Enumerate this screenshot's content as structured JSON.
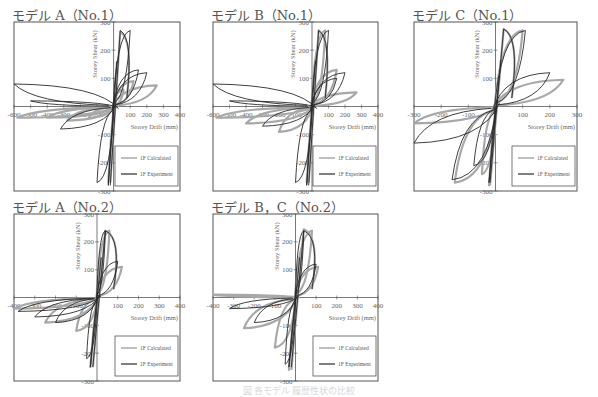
{
  "caption": "図 各モデル 履歴性状の比較",
  "colors": {
    "calculated": "#a8a8a8",
    "experiment": "#2a2a2a",
    "frame": "#555555"
  },
  "legend": {
    "calculated": "1F Calculated",
    "experiment": "1F Experiment"
  },
  "chart_data": [
    {
      "type": "line",
      "title": "モデル A（No.1）",
      "xlabel": "Storey Drift (mm)",
      "ylabel": "Storey Shear (kN)",
      "xlim": [
        -600,
        400
      ],
      "ylim": [
        -300,
        300
      ],
      "xticks": [
        -600,
        -500,
        -400,
        -300,
        -200,
        -100,
        100,
        200,
        300,
        400
      ],
      "yticks": [
        300,
        200,
        100,
        -100,
        -200,
        -300
      ],
      "box": [
        14,
        22,
        180,
        191
      ],
      "series": [
        {
          "name": "1F Calculated",
          "peaks": [
            [
              260,
              75
            ],
            [
              120,
              90
            ],
            [
              60,
              60
            ],
            [
              -150,
              -40
            ],
            [
              -280,
              -50
            ],
            [
              -400,
              -40
            ],
            [
              -580,
              -40
            ]
          ],
          "ymax": 265,
          "ymin": -270
        },
        {
          "name": "1F Experiment",
          "peaks": [
            [
              100,
              270
            ],
            [
              200,
              120
            ],
            [
              150,
              130
            ],
            [
              -100,
              -270
            ],
            [
              -320,
              -80
            ],
            [
              -500,
              20
            ],
            [
              -600,
              80
            ]
          ],
          "ymax": 270,
          "ymin": -280
        }
      ]
    },
    {
      "type": "line",
      "title": "モデル B（No.1）",
      "xlabel": "Storey Drift (mm)",
      "ylabel": "Storey Shear (kN)",
      "xlim": [
        -600,
        400
      ],
      "ylim": [
        -300,
        300
      ],
      "xticks": [
        -600,
        -500,
        -400,
        -300,
        -200,
        -100,
        100,
        200,
        300,
        400
      ],
      "yticks": [
        300,
        200,
        100,
        -100,
        -200,
        -300
      ],
      "box": [
        213,
        22,
        378,
        191
      ],
      "series": [
        {
          "name": "1F Calculated",
          "peaks": [
            [
              270,
              50
            ],
            [
              150,
              130
            ],
            [
              80,
              270
            ],
            [
              -200,
              -90
            ],
            [
              -400,
              -60
            ],
            [
              -580,
              -40
            ]
          ],
          "ymax": 270,
          "ymin": -270
        },
        {
          "name": "1F Experiment",
          "peaks": [
            [
              100,
              270
            ],
            [
              200,
              120
            ],
            [
              150,
              100
            ],
            [
              -100,
              -270
            ],
            [
              -300,
              -70
            ],
            [
              -500,
              20
            ],
            [
              -600,
              80
            ]
          ],
          "ymax": 270,
          "ymin": -280
        }
      ]
    },
    {
      "type": "line",
      "title": "モデル C（No.1）",
      "xlabel": "Storey Drift (mm)",
      "ylabel": "Storey Shear (kN)",
      "xlim": [
        -300,
        300
      ],
      "ylim": [
        -300,
        300
      ],
      "xticks": [
        -300,
        -200,
        -100,
        100,
        200,
        300
      ],
      "yticks": [
        300,
        200,
        100,
        -100,
        -200,
        -300
      ],
      "box": [
        414,
        22,
        577,
        191
      ],
      "series": [
        {
          "name": "1F Calculated",
          "peaks": [
            [
              250,
              95
            ],
            [
              100,
              270
            ],
            [
              -50,
              -240
            ],
            [
              -150,
              -270
            ],
            [
              -300,
              -60
            ]
          ],
          "ymax": 275,
          "ymin": -280
        },
        {
          "name": "1F Experiment",
          "peaks": [
            [
              200,
              120
            ],
            [
              110,
              270
            ],
            [
              -80,
              -210
            ],
            [
              -160,
              -260
            ],
            [
              -300,
              -130
            ]
          ],
          "ymax": 275,
          "ymin": -270
        }
      ]
    },
    {
      "type": "line",
      "title": "モデル A（No.2）",
      "xlabel": "Storey Drift (mm)",
      "ylabel": "Storey Shear (kN)",
      "xlim": [
        -400,
        400
      ],
      "ylim": [
        -300,
        300
      ],
      "xticks": [
        -400,
        -300,
        -200,
        -100,
        100,
        200,
        300,
        400
      ],
      "yticks": [
        300,
        200,
        100,
        -100,
        -200,
        -300
      ],
      "box": [
        14,
        214,
        180,
        381
      ],
      "series": [
        {
          "name": "1F Calculated",
          "peaks": [
            [
              120,
              110
            ],
            [
              60,
              240
            ],
            [
              -100,
              -120
            ],
            [
              -250,
              -90
            ],
            [
              -400,
              -40
            ]
          ],
          "ymax": 240,
          "ymin": -250
        },
        {
          "name": "1F Experiment",
          "peaks": [
            [
              100,
              130
            ],
            [
              40,
              240
            ],
            [
              -50,
              -220
            ],
            [
              -200,
              -90
            ],
            [
              -300,
              -70
            ],
            [
              -380,
              -50
            ]
          ],
          "ymax": 240,
          "ymin": -250
        }
      ]
    },
    {
      "type": "line",
      "title": "モデル B，C（No.2）",
      "xlabel": "Storey Drift (mm)",
      "ylabel": "Storey Shear (kN)",
      "xlim": [
        -400,
        400
      ],
      "ylim": [
        -300,
        300
      ],
      "xticks": [
        -400,
        -300,
        -200,
        -100,
        100,
        200,
        300,
        400
      ],
      "yticks": [
        300,
        200,
        100,
        -100,
        -200,
        -300
      ],
      "box": [
        213,
        214,
        378,
        381
      ],
      "series": [
        {
          "name": "1F Calculated",
          "peaks": [
            [
              110,
              110
            ],
            [
              80,
              240
            ],
            [
              -100,
              -180
            ],
            [
              -250,
              -110
            ],
            [
              -400,
              10
            ]
          ],
          "ymax": 245,
          "ymin": -260
        },
        {
          "name": "1F Experiment",
          "peaks": [
            [
              100,
              120
            ],
            [
              40,
              240
            ],
            [
              -50,
              -240
            ],
            [
              -200,
              -90
            ],
            [
              -320,
              -40
            ]
          ],
          "ymax": 240,
          "ymin": -250
        }
      ]
    }
  ]
}
